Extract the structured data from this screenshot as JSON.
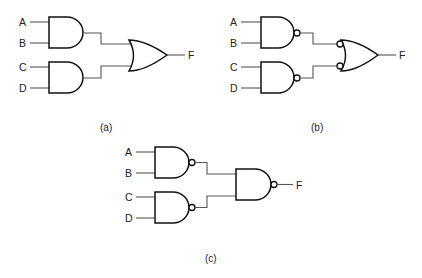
{
  "diagram": {
    "colors": {
      "background": "#ffffff",
      "gate_stroke": "#111111",
      "wire": "#555555",
      "text": "#222222"
    },
    "panels": [
      {
        "id": "a",
        "caption": "(a)",
        "inputs": [
          "A",
          "B",
          "C",
          "D"
        ],
        "output": "F",
        "first_level_gates": [
          "AND",
          "AND"
        ],
        "second_level_gate": "OR"
      },
      {
        "id": "b",
        "caption": "(b)",
        "inputs": [
          "A",
          "B",
          "C",
          "D"
        ],
        "output": "F",
        "first_level_gates": [
          "NAND",
          "NAND"
        ],
        "second_level_gate": "OR with inverted inputs"
      },
      {
        "id": "c",
        "caption": "(c)",
        "inputs": [
          "A",
          "B",
          "C",
          "D"
        ],
        "output": "F",
        "first_level_gates": [
          "NAND",
          "NAND"
        ],
        "second_level_gate": "NAND"
      }
    ]
  }
}
